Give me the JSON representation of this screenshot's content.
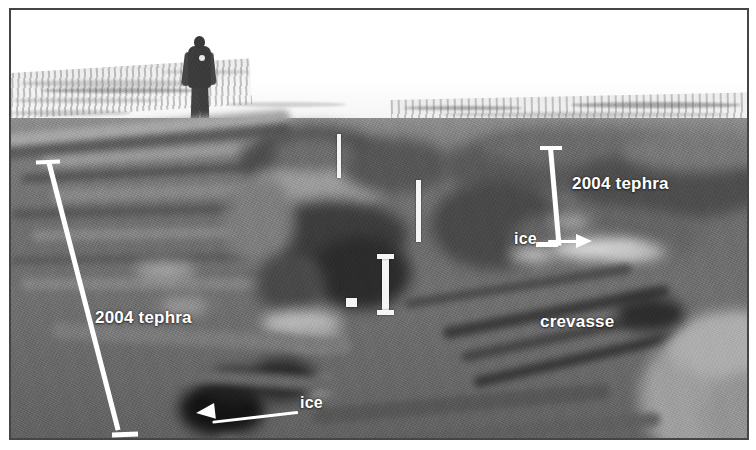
{
  "figure": {
    "kind": "annotated-field-photograph",
    "color_mode": "grayscale",
    "frame_border_color": "#43454a",
    "annotation_color": "#ffffff"
  },
  "annotations": [
    {
      "id": "tephra-left",
      "label": "2004 tephra",
      "type": "text-with-scalebar",
      "note": "lower-left unit thickness"
    },
    {
      "id": "tephra-right",
      "label": "2004 tephra",
      "type": "text-with-scalebar",
      "note": "right-hand wall unit thickness"
    },
    {
      "id": "ice-left",
      "label": "ice",
      "type": "text-with-arrow",
      "arrow_direction": "left"
    },
    {
      "id": "ice-right",
      "label": "ice",
      "type": "text-with-arrow",
      "arrow_direction": "right"
    },
    {
      "id": "crevasse",
      "label": "crevasse",
      "type": "text"
    }
  ],
  "scene": {
    "person_label": "person-for-scale",
    "poles_label": "measuring-pole",
    "sky_label": "snowfield-horizon"
  }
}
